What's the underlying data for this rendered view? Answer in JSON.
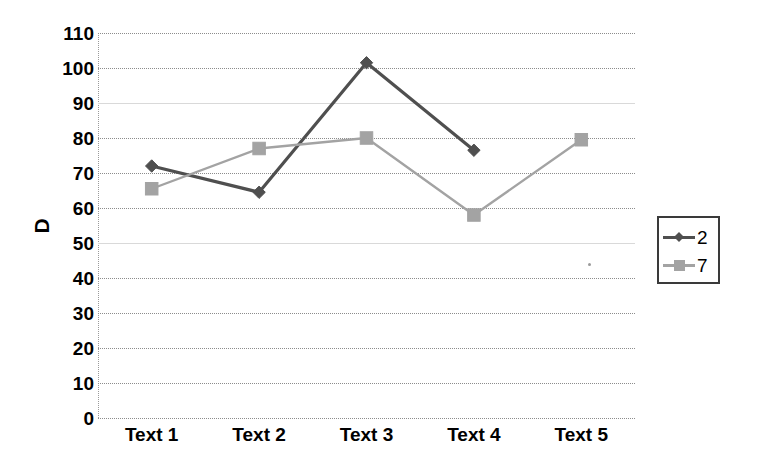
{
  "chart_data": {
    "type": "line",
    "title": "",
    "xlabel": "",
    "ylabel": "D",
    "categories": [
      "Text 1",
      "Text 2",
      "Text 3",
      "Text 4",
      "Text 5"
    ],
    "ylim": [
      0,
      110
    ],
    "ytick_step": 10,
    "yticks": [
      110,
      100,
      90,
      80,
      70,
      60,
      50,
      40,
      30,
      20,
      10,
      0
    ],
    "grid": true,
    "legend_position": "right",
    "series": [
      {
        "name": "2",
        "color": "#4f4f4f",
        "marker": "diamond",
        "values": [
          72,
          64.5,
          101.5,
          76.5,
          null
        ]
      },
      {
        "name": "7",
        "color": "#a3a3a3",
        "marker": "square",
        "values": [
          65.5,
          77,
          80,
          58,
          79.5
        ]
      }
    ]
  },
  "legend": {
    "entries": [
      {
        "label": "2"
      },
      {
        "label": "7"
      }
    ]
  },
  "axes": {
    "y_title": "D"
  },
  "colors": {
    "series_2": "#4f4f4f",
    "series_7": "#a3a3a3",
    "gridline": "#8c8c8c",
    "axis_text": "#000000",
    "background": "#ffffff",
    "legend_border": "#3a3a3a"
  },
  "icons": {
    "diamond_marker": "diamond-marker-icon",
    "square_marker": "square-marker-icon"
  }
}
